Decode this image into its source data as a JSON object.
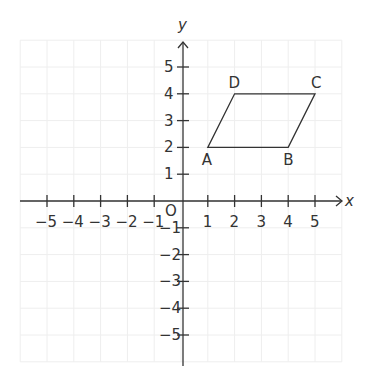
{
  "diagram": {
    "type": "coordinate-plane",
    "axes": {
      "x_label": "x",
      "y_label": "y",
      "origin_label": "O",
      "x_ticks": [
        -5,
        -4,
        -3,
        -2,
        -1,
        1,
        2,
        3,
        4,
        5
      ],
      "y_ticks": [
        5,
        4,
        3,
        2,
        1,
        -1,
        -2,
        -3,
        -4,
        -5
      ],
      "grid_range": [
        -6,
        6
      ]
    },
    "shape": {
      "name": "parallelogram ABCD",
      "vertices": [
        {
          "label": "A",
          "x": 1,
          "y": 2
        },
        {
          "label": "B",
          "x": 4,
          "y": 2
        },
        {
          "label": "C",
          "x": 5,
          "y": 4
        },
        {
          "label": "D",
          "x": 2,
          "y": 4
        }
      ]
    },
    "colors": {
      "axis": "#333333",
      "grid": "#eeeeee",
      "shape": "#333333"
    }
  }
}
